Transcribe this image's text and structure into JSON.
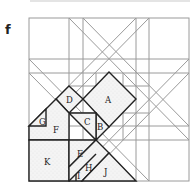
{
  "figure": {
    "panel_label": "f",
    "grid_color": "#9a9a9a",
    "outline_color": "#222222",
    "fill_color": "#f1f1f1"
  },
  "pieces": [
    {
      "id": "A",
      "label": "A"
    },
    {
      "id": "B",
      "label": "B"
    },
    {
      "id": "C",
      "label": "C"
    },
    {
      "id": "D",
      "label": "D"
    },
    {
      "id": "E",
      "label": "E"
    },
    {
      "id": "F",
      "label": "F"
    },
    {
      "id": "G",
      "label": "G"
    },
    {
      "id": "H",
      "label": "H"
    },
    {
      "id": "I",
      "label": "I"
    },
    {
      "id": "J",
      "label": "J"
    },
    {
      "id": "K",
      "label": "K"
    }
  ]
}
